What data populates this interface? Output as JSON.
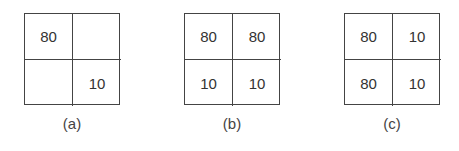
{
  "panels": [
    {
      "label": "(a)",
      "cells": [
        "80",
        "",
        "",
        "10"
      ]
    },
    {
      "label": "(b)",
      "cells": [
        "80",
        "80",
        "10",
        "10"
      ]
    },
    {
      "label": "(c)",
      "cells": [
        "80",
        "10",
        "80",
        "10"
      ]
    }
  ]
}
